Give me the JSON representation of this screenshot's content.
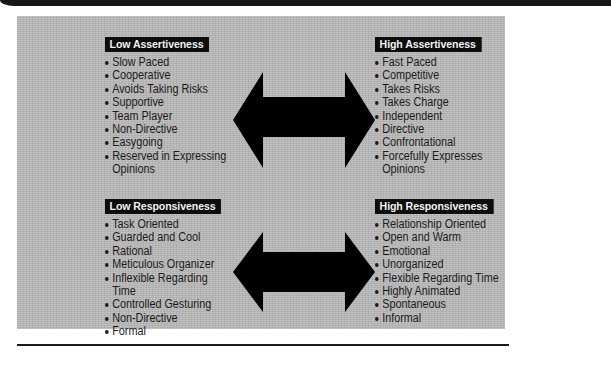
{
  "diagram": {
    "colors": {
      "panel_background": "#b9b9b9",
      "header_background": "#0d0d0d",
      "header_text": "#f2f2f2",
      "arrow": "#000000",
      "body_text": "#1b1b1b"
    },
    "quadrants": {
      "low_assertiveness": {
        "heading": "Low Assertiveness",
        "items": [
          "Slow Paced",
          "Cooperative",
          "Avoids Taking Risks",
          "Supportive",
          "Team Player",
          "Non-Directive",
          "Easygoing",
          "Reserved in Expressing Opinions"
        ]
      },
      "high_assertiveness": {
        "heading": "High Assertiveness",
        "items": [
          "Fast Paced",
          "Competitive",
          "Takes Risks",
          "Takes Charge",
          "Independent",
          "Directive",
          "Confrontational",
          "Forcefully Expresses Opinions"
        ]
      },
      "low_responsiveness": {
        "heading": "Low Responsiveness",
        "items": [
          "Task Oriented",
          "Guarded and Cool",
          "Rational",
          "Meticulous Organizer",
          "Inflexible Regarding Time",
          "Controlled Gesturing",
          "Non-Directive",
          "Formal"
        ]
      },
      "high_responsiveness": {
        "heading": "High Responsiveness",
        "items": [
          "Relationship Oriented",
          "Open and Warm",
          "Emotional",
          "Unorganized",
          "Flexible Regarding Time",
          "Highly Animated",
          "Spontaneous",
          "Informal"
        ]
      }
    },
    "arrows": [
      {
        "name": "assertiveness-scale-arrow",
        "type": "double-headed",
        "connects": [
          "Low Assertiveness",
          "High Assertiveness"
        ]
      },
      {
        "name": "responsiveness-scale-arrow",
        "type": "double-headed",
        "connects": [
          "Low Responsiveness",
          "High Responsiveness"
        ]
      }
    ]
  }
}
